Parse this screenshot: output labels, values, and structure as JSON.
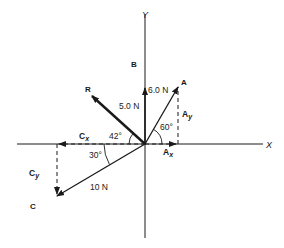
{
  "diagram": {
    "type": "vector-addition",
    "axes": {
      "x_label": "X",
      "y_label": "Y"
    },
    "vectors": {
      "A": {
        "label": "A",
        "magnitude_label": "6.0 N",
        "angle_label": "60°",
        "x_component": "Ax",
        "y_component": "Ay"
      },
      "B": {
        "label": "B",
        "magnitude_label": "5.0 N"
      },
      "C": {
        "label": "C",
        "magnitude_label": "10 N",
        "angle_label": "30°",
        "x_component": "Cx",
        "y_component": "Cy"
      },
      "R": {
        "label": "R",
        "angle_label": "42°"
      }
    },
    "components": {
      "Ax": {
        "base": "A",
        "sub": "x"
      },
      "Ay": {
        "base": "A",
        "sub": "y"
      },
      "Cx": {
        "base": "C",
        "sub": "x"
      },
      "Cy": {
        "base": "C",
        "sub": "y"
      }
    },
    "colors": {
      "ink": "#1a1a1a",
      "background": "#ffffff"
    }
  }
}
